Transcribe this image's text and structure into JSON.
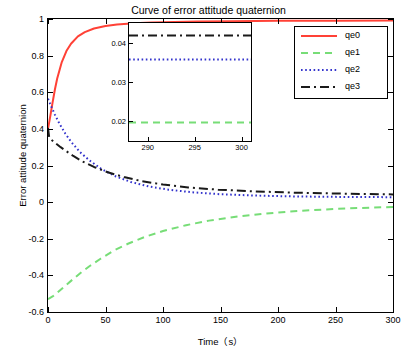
{
  "chart_data": {
    "type": "line",
    "title": "Curve of error attitude quaternion",
    "xlabel": "Time（s）",
    "ylabel": "Error attitude quaternion",
    "xlim": [
      0,
      300
    ],
    "ylim": [
      -0.6,
      1.0
    ],
    "xticks": [
      0,
      50,
      100,
      150,
      200,
      250,
      300
    ],
    "xticklabels": [
      "0",
      "50",
      "100",
      "150",
      "200",
      "250",
      "300"
    ],
    "yticks": [
      -0.6,
      -0.4,
      -0.2,
      0,
      0.2,
      0.4,
      0.6,
      0.8,
      1
    ],
    "yticklabels": [
      "-0.6",
      "-0.4",
      "-0.2",
      "0",
      "0.2",
      "0.4",
      "0.6",
      "0.8",
      "1"
    ],
    "grid": false,
    "legend_position": "upper right",
    "legend": [
      "qe0",
      "qe1",
      "qe2",
      "qe3"
    ],
    "colors": {
      "qe0": "#ff4136",
      "qe1": "#77dd77",
      "qe2": "#3333cc",
      "qe3": "#1a1a1a"
    },
    "series": [
      {
        "name": "qe0",
        "color": "#ff4136",
        "style": "solid",
        "x": [
          0,
          2,
          4,
          6,
          8,
          12,
          16,
          20,
          26,
          32,
          40,
          50,
          60,
          75,
          90,
          110,
          130,
          160,
          200,
          250,
          300
        ],
        "y": [
          0.4,
          0.47,
          0.545,
          0.615,
          0.675,
          0.765,
          0.825,
          0.865,
          0.905,
          0.928,
          0.948,
          0.962,
          0.97,
          0.977,
          0.981,
          0.984,
          0.986,
          0.988,
          0.99,
          0.991,
          0.992
        ]
      },
      {
        "name": "qe1",
        "color": "#77dd77",
        "style": "dashed",
        "x": [
          0,
          4,
          8,
          14,
          20,
          28,
          36,
          46,
          58,
          70,
          85,
          100,
          120,
          140,
          165,
          190,
          220,
          250,
          280,
          300
        ],
        "y": [
          -0.53,
          -0.515,
          -0.495,
          -0.462,
          -0.43,
          -0.388,
          -0.35,
          -0.308,
          -0.262,
          -0.226,
          -0.188,
          -0.158,
          -0.126,
          -0.101,
          -0.078,
          -0.062,
          -0.047,
          -0.037,
          -0.03,
          -0.027
        ]
      },
      {
        "name": "qe2",
        "color": "#3333cc",
        "style": "dotted",
        "x": [
          0,
          3,
          6,
          10,
          15,
          20,
          28,
          36,
          46,
          58,
          72,
          88,
          105,
          125,
          150,
          175,
          205,
          240,
          270,
          300
        ],
        "y": [
          0.565,
          0.52,
          0.478,
          0.428,
          0.375,
          0.33,
          0.272,
          0.228,
          0.183,
          0.143,
          0.11,
          0.085,
          0.068,
          0.054,
          0.043,
          0.037,
          0.032,
          0.029,
          0.028,
          0.027
        ]
      },
      {
        "name": "qe3",
        "color": "#1a1a1a",
        "style": "dashdot",
        "x": [
          0,
          1,
          2,
          4,
          7,
          11,
          16,
          22,
          30,
          40,
          52,
          66,
          82,
          100,
          122,
          148,
          178,
          212,
          250,
          300
        ],
        "y": [
          0.405,
          0.355,
          0.345,
          0.335,
          0.32,
          0.3,
          0.278,
          0.252,
          0.222,
          0.192,
          0.163,
          0.137,
          0.114,
          0.096,
          0.08,
          0.068,
          0.059,
          0.052,
          0.047,
          0.042
        ]
      }
    ],
    "inset": {
      "xlim": [
        288,
        301
      ],
      "ylim": [
        0.015,
        0.045
      ],
      "xticks": [
        290,
        295,
        300
      ],
      "xticklabels": [
        "290",
        "295",
        "300"
      ],
      "yticks": [
        0.02,
        0.03,
        0.04
      ],
      "yticklabels": [
        "0.02",
        "0.03",
        "0.04"
      ],
      "series": [
        {
          "name": "qe0",
          "color": "#ff4136",
          "style": "solid",
          "x": [
            288,
            301
          ],
          "y": [
            0.9924,
            0.9925
          ]
        },
        {
          "name": "qe1",
          "color": "#77dd77",
          "style": "dashed",
          "x": [
            288,
            301
          ],
          "y": [
            0.0197,
            0.0197
          ]
        },
        {
          "name": "qe2",
          "color": "#3333cc",
          "style": "dotted",
          "x": [
            288,
            301
          ],
          "y": [
            0.0357,
            0.0357
          ]
        },
        {
          "name": "qe3",
          "color": "#1a1a1a",
          "style": "dashdot",
          "x": [
            288,
            301
          ],
          "y": [
            0.0418,
            0.0418
          ]
        }
      ]
    }
  }
}
